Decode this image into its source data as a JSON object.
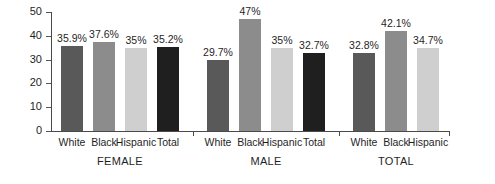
{
  "chart_data": {
    "type": "bar",
    "title": "",
    "xlabel": "",
    "ylabel": "Percent",
    "ylim": [
      0,
      50
    ],
    "yticks": [
      0,
      10,
      20,
      30,
      40,
      50
    ],
    "ytick_labels": [
      "0",
      "10",
      "20",
      "30",
      "40",
      "50"
    ],
    "grid": false,
    "legend": "none",
    "categories": [
      "White",
      "Black",
      "Hispanic",
      "Total"
    ],
    "groups": [
      {
        "name": "FEMALE",
        "bars": [
          {
            "category": "White",
            "value": 35.9,
            "label": "35.9%",
            "color": "#595959"
          },
          {
            "category": "Black",
            "value": 37.6,
            "label": "37.6%",
            "color": "#8c8c8c"
          },
          {
            "category": "Hispanic",
            "value": 35.0,
            "label": "35%",
            "color": "#cfcfcf"
          },
          {
            "category": "Total",
            "value": 35.2,
            "label": "35.2%",
            "color": "#1f1f1f"
          }
        ]
      },
      {
        "name": "MALE",
        "bars": [
          {
            "category": "White",
            "value": 29.7,
            "label": "29.7%",
            "color": "#595959"
          },
          {
            "category": "Black",
            "value": 47.0,
            "label": "47%",
            "color": "#8c8c8c"
          },
          {
            "category": "Hispanic",
            "value": 35.0,
            "label": "35%",
            "color": "#cfcfcf"
          },
          {
            "category": "Total",
            "value": 32.7,
            "label": "32.7%",
            "color": "#1f1f1f"
          }
        ]
      },
      {
        "name": "TOTAL",
        "bars": [
          {
            "category": "White",
            "value": 32.8,
            "label": "32.8%",
            "color": "#595959"
          },
          {
            "category": "Black",
            "value": 42.1,
            "label": "42.1%",
            "color": "#8c8c8c"
          },
          {
            "category": "Hispanic",
            "value": 34.7,
            "label": "34.7%",
            "color": "#cfcfcf"
          }
        ]
      }
    ]
  },
  "axis": {
    "line_color": "#4a4a4a"
  }
}
